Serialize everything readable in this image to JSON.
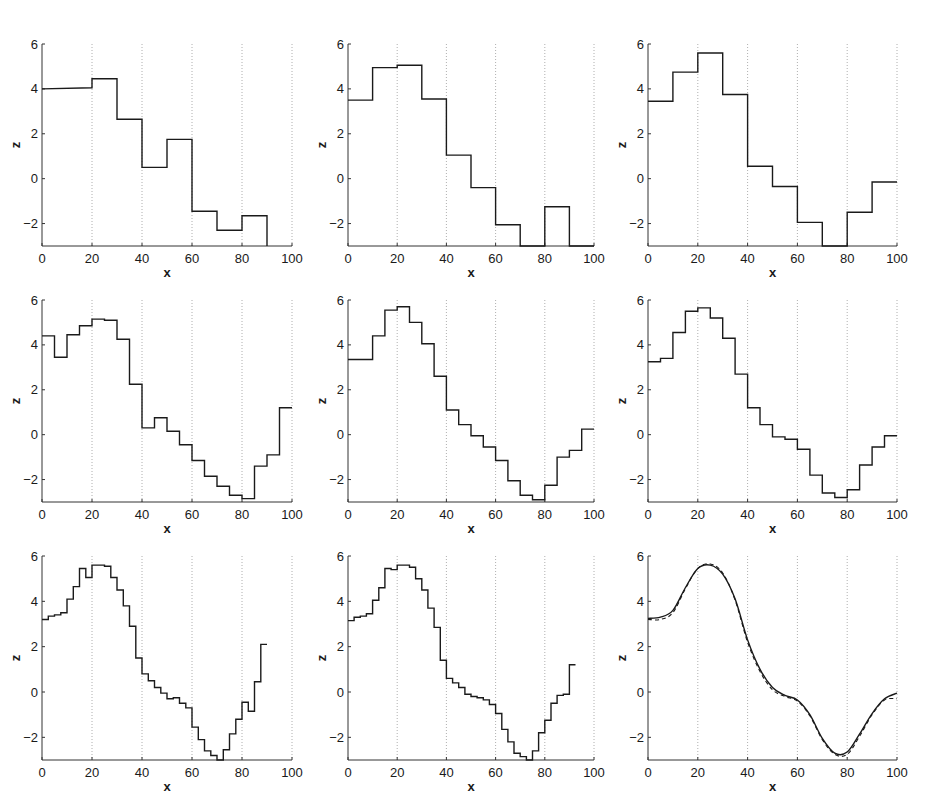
{
  "figure": {
    "background": "#ffffff",
    "line_color": "#1a1a1a",
    "grid_color": "#9a9a9a"
  },
  "chart_data": [
    {
      "type": "line",
      "panel": 1,
      "row": 1,
      "col": 1,
      "style": "step",
      "xlabel": "x",
      "ylabel": "z",
      "xlim": [
        0,
        100
      ],
      "ylim": [
        -3,
        6
      ],
      "xticks": [
        0,
        20,
        40,
        60,
        80,
        100
      ],
      "yticks": [
        -2,
        0,
        2,
        4,
        6
      ],
      "grid": "vertical-dotted",
      "series": [
        {
          "name": "approximation",
          "dash": "solid",
          "x": [
            0,
            20,
            20,
            30,
            30,
            40,
            40,
            50,
            50,
            60,
            60,
            70,
            70,
            80,
            80,
            90,
            90
          ],
          "y": [
            4.0,
            4.05,
            4.45,
            4.45,
            2.65,
            2.65,
            0.5,
            0.5,
            1.75,
            1.75,
            -1.45,
            -1.45,
            -2.3,
            -2.3,
            -1.65,
            -1.65,
            -3.0
          ]
        }
      ]
    },
    {
      "type": "line",
      "panel": 2,
      "row": 1,
      "col": 2,
      "style": "step",
      "xlabel": "x",
      "ylabel": "z",
      "xlim": [
        0,
        100
      ],
      "ylim": [
        -3,
        6
      ],
      "xticks": [
        0,
        20,
        40,
        60,
        80,
        100
      ],
      "yticks": [
        -2,
        0,
        2,
        4,
        6
      ],
      "grid": "vertical-dotted",
      "series": [
        {
          "name": "approximation",
          "dash": "solid",
          "x": [
            0,
            10,
            10,
            20,
            20,
            30,
            30,
            40,
            40,
            50,
            50,
            60,
            60,
            70,
            70,
            80,
            80,
            90,
            90,
            100
          ],
          "y": [
            3.5,
            3.5,
            4.95,
            4.95,
            5.05,
            5.05,
            3.55,
            3.55,
            1.05,
            1.05,
            -0.4,
            -0.4,
            -2.05,
            -2.05,
            -3.0,
            -3.0,
            -1.25,
            -1.25,
            -3.0,
            -3.0
          ]
        }
      ]
    },
    {
      "type": "line",
      "panel": 3,
      "row": 1,
      "col": 3,
      "style": "step",
      "xlabel": "x",
      "ylabel": "z",
      "xlim": [
        0,
        100
      ],
      "ylim": [
        -3,
        6
      ],
      "xticks": [
        0,
        20,
        40,
        60,
        80,
        100
      ],
      "yticks": [
        -2,
        0,
        2,
        4,
        6
      ],
      "grid": "vertical-dotted",
      "series": [
        {
          "name": "approximation",
          "dash": "solid",
          "x": [
            0,
            10,
            10,
            20,
            20,
            30,
            30,
            40,
            40,
            50,
            50,
            60,
            60,
            70,
            70,
            80,
            80,
            90,
            90,
            100
          ],
          "y": [
            3.45,
            3.45,
            4.75,
            4.75,
            5.6,
            5.6,
            3.75,
            3.75,
            0.55,
            0.55,
            -0.35,
            -0.35,
            -1.95,
            -1.95,
            -3.0,
            -3.0,
            -1.5,
            -1.5,
            -0.15,
            -0.15
          ]
        }
      ]
    },
    {
      "type": "line",
      "panel": 4,
      "row": 2,
      "col": 1,
      "style": "step",
      "xlabel": "x",
      "ylabel": "z",
      "xlim": [
        0,
        100
      ],
      "ylim": [
        -3,
        6
      ],
      "xticks": [
        0,
        20,
        40,
        60,
        80,
        100
      ],
      "yticks": [
        -2,
        0,
        2,
        4,
        6
      ],
      "grid": "vertical-dotted",
      "series": [
        {
          "name": "approximation",
          "dash": "solid",
          "x": [
            0,
            5,
            5,
            10,
            10,
            15,
            15,
            20,
            20,
            25,
            25,
            30,
            30,
            35,
            35,
            40,
            40,
            45,
            45,
            50,
            50,
            55,
            55,
            60,
            60,
            65,
            65,
            70,
            70,
            75,
            75,
            80,
            80,
            85,
            85,
            90,
            90,
            95,
            95,
            100
          ],
          "y": [
            4.4,
            4.4,
            3.45,
            3.45,
            4.45,
            4.45,
            4.85,
            4.85,
            5.15,
            5.15,
            5.1,
            5.1,
            4.25,
            4.25,
            2.25,
            2.25,
            0.3,
            0.3,
            0.75,
            0.75,
            0.15,
            0.15,
            -0.45,
            -0.45,
            -1.15,
            -1.15,
            -1.85,
            -1.85,
            -2.3,
            -2.3,
            -2.7,
            -2.7,
            -2.85,
            -2.85,
            -1.4,
            -1.4,
            -0.9,
            -0.9,
            1.2,
            1.2
          ]
        }
      ]
    },
    {
      "type": "line",
      "panel": 5,
      "row": 2,
      "col": 2,
      "style": "step",
      "xlabel": "x",
      "ylabel": "z",
      "xlim": [
        0,
        100
      ],
      "ylim": [
        -3,
        6
      ],
      "xticks": [
        0,
        20,
        40,
        60,
        80,
        100
      ],
      "yticks": [
        -2,
        0,
        2,
        4,
        6
      ],
      "grid": "vertical-dotted",
      "series": [
        {
          "name": "approximation",
          "dash": "solid",
          "x": [
            0,
            10,
            10,
            15,
            15,
            20,
            20,
            25,
            25,
            30,
            30,
            35,
            35,
            40,
            40,
            45,
            45,
            50,
            50,
            55,
            55,
            60,
            60,
            65,
            65,
            70,
            70,
            75,
            75,
            80,
            80,
            85,
            85,
            90,
            90,
            95,
            95,
            100
          ],
          "y": [
            3.35,
            3.35,
            4.4,
            4.4,
            5.55,
            5.55,
            5.7,
            5.7,
            5.0,
            5.0,
            4.05,
            4.05,
            2.6,
            2.6,
            1.1,
            1.1,
            0.45,
            0.45,
            -0.05,
            -0.05,
            -0.55,
            -0.55,
            -1.15,
            -1.15,
            -2.05,
            -2.05,
            -2.7,
            -2.7,
            -2.9,
            -2.9,
            -2.25,
            -2.25,
            -1.0,
            -1.0,
            -0.7,
            -0.7,
            0.25,
            0.25
          ]
        }
      ]
    },
    {
      "type": "line",
      "panel": 6,
      "row": 2,
      "col": 3,
      "style": "step",
      "xlabel": "x",
      "ylabel": "z",
      "xlim": [
        0,
        100
      ],
      "ylim": [
        -3,
        6
      ],
      "xticks": [
        0,
        20,
        40,
        60,
        80,
        100
      ],
      "yticks": [
        -2,
        0,
        2,
        4,
        6
      ],
      "grid": "vertical-dotted",
      "series": [
        {
          "name": "approximation",
          "dash": "solid",
          "x": [
            0,
            5,
            5,
            10,
            10,
            15,
            15,
            20,
            20,
            25,
            25,
            30,
            30,
            35,
            35,
            40,
            40,
            45,
            45,
            50,
            50,
            55,
            55,
            60,
            60,
            65,
            65,
            70,
            70,
            75,
            75,
            80,
            80,
            85,
            85,
            90,
            90,
            95,
            95,
            100
          ],
          "y": [
            3.25,
            3.25,
            3.4,
            3.4,
            4.55,
            4.55,
            5.5,
            5.5,
            5.65,
            5.65,
            5.2,
            5.2,
            4.3,
            4.3,
            2.7,
            2.7,
            1.2,
            1.2,
            0.45,
            0.45,
            -0.1,
            -0.1,
            -0.2,
            -0.2,
            -0.65,
            -0.65,
            -1.8,
            -1.8,
            -2.6,
            -2.6,
            -2.8,
            -2.8,
            -2.45,
            -2.45,
            -1.35,
            -1.35,
            -0.55,
            -0.55,
            -0.05,
            -0.05
          ]
        }
      ]
    },
    {
      "type": "line",
      "panel": 7,
      "row": 3,
      "col": 1,
      "style": "step",
      "xlabel": "x",
      "ylabel": "z",
      "xlim": [
        0,
        100
      ],
      "ylim": [
        -3,
        6
      ],
      "xticks": [
        0,
        20,
        40,
        60,
        80,
        100
      ],
      "yticks": [
        -2,
        0,
        2,
        4,
        6
      ],
      "grid": "vertical-dotted",
      "series": [
        {
          "name": "approximation",
          "dash": "solid",
          "x": [
            0,
            2.5,
            2.5,
            5,
            5,
            7.5,
            7.5,
            10,
            10,
            12.5,
            12.5,
            15,
            15,
            17.5,
            17.5,
            20,
            20,
            22.5,
            22.5,
            25,
            25,
            27.5,
            27.5,
            30,
            30,
            32.5,
            32.5,
            35,
            35,
            37.5,
            37.5,
            40,
            40,
            42.5,
            42.5,
            45,
            45,
            47.5,
            47.5,
            50,
            50,
            52.5,
            52.5,
            55,
            55,
            57.5,
            57.5,
            60,
            60,
            62.5,
            62.5,
            65,
            65,
            67.5,
            67.5,
            70,
            70,
            72.5,
            72.5,
            75,
            75,
            77.5,
            77.5,
            80,
            80,
            82.5,
            82.5,
            85,
            85,
            87.5,
            87.5,
            90,
            90,
            92.5,
            92.5,
            95,
            95,
            97.5,
            97.5,
            100
          ],
          "y": [
            3.2,
            3.2,
            3.35,
            3.35,
            3.4,
            3.4,
            3.5,
            3.5,
            4.1,
            4.1,
            4.65,
            4.65,
            5.45,
            5.45,
            5.05,
            5.05,
            5.6,
            5.6,
            5.6,
            5.6,
            5.55,
            5.55,
            5.05,
            5.05,
            4.5,
            4.5,
            3.8,
            3.8,
            2.9,
            2.9,
            1.5,
            1.5,
            0.8,
            0.8,
            0.5,
            0.5,
            0.2,
            0.2,
            -0.05,
            -0.05,
            -0.3,
            -0.3,
            -0.25,
            -0.25,
            -0.5,
            -0.5,
            -0.7,
            -0.7,
            -1.55,
            -1.55,
            -2.1,
            -2.1,
            -2.6,
            -2.6,
            -2.8,
            -2.8,
            -3.0,
            -3.0,
            -2.55,
            -2.55,
            -1.85,
            -1.85,
            -1.2,
            -1.2,
            -0.45,
            -0.45,
            -0.85,
            -0.85,
            0.45,
            0.45,
            2.1,
            2.1
          ]
        }
      ]
    },
    {
      "type": "line",
      "panel": 8,
      "row": 3,
      "col": 2,
      "style": "step",
      "xlabel": "x",
      "ylabel": "z",
      "xlim": [
        0,
        100
      ],
      "ylim": [
        -3,
        6
      ],
      "xticks": [
        0,
        20,
        40,
        60,
        80,
        100
      ],
      "yticks": [
        -2,
        0,
        2,
        4,
        6
      ],
      "grid": "vertical-dotted",
      "series": [
        {
          "name": "approximation",
          "dash": "solid",
          "x": [
            0,
            2.5,
            2.5,
            5,
            5,
            7.5,
            7.5,
            10,
            10,
            12.5,
            12.5,
            15,
            15,
            17.5,
            17.5,
            20,
            20,
            22.5,
            22.5,
            25,
            25,
            27.5,
            27.5,
            30,
            30,
            32.5,
            32.5,
            35,
            35,
            37.5,
            37.5,
            40,
            40,
            42.5,
            42.5,
            45,
            45,
            47.5,
            47.5,
            50,
            50,
            52.5,
            52.5,
            55,
            55,
            57.5,
            57.5,
            60,
            60,
            62.5,
            62.5,
            65,
            65,
            67.5,
            67.5,
            70,
            70,
            72.5,
            72.5,
            75,
            75,
            77.5,
            77.5,
            80,
            80,
            82.5,
            82.5,
            85,
            85,
            87.5,
            87.5,
            90,
            90,
            92.5,
            92.5,
            95,
            95,
            97.5,
            97.5,
            100
          ],
          "y": [
            3.15,
            3.15,
            3.3,
            3.3,
            3.35,
            3.35,
            3.45,
            3.45,
            4.05,
            4.05,
            4.6,
            4.6,
            5.45,
            5.45,
            5.4,
            5.4,
            5.6,
            5.6,
            5.6,
            5.6,
            5.5,
            5.5,
            5.0,
            5.0,
            4.5,
            4.5,
            3.7,
            3.7,
            2.85,
            2.85,
            1.4,
            1.4,
            0.6,
            0.6,
            0.4,
            0.4,
            0.2,
            0.2,
            -0.1,
            -0.1,
            -0.2,
            -0.2,
            -0.25,
            -0.25,
            -0.35,
            -0.35,
            -0.55,
            -0.55,
            -0.95,
            -0.95,
            -1.65,
            -1.65,
            -2.2,
            -2.2,
            -2.7,
            -2.7,
            -2.85,
            -2.85,
            -3.0,
            -3.0,
            -2.6,
            -2.6,
            -1.8,
            -1.8,
            -1.25,
            -1.25,
            -0.5,
            -0.5,
            -0.15,
            -0.15,
            -0.1,
            -0.1,
            1.2,
            1.2
          ]
        }
      ]
    },
    {
      "type": "line",
      "panel": 9,
      "row": 3,
      "col": 3,
      "style": "smooth",
      "xlabel": "x",
      "ylabel": "z",
      "xlim": [
        0,
        100
      ],
      "ylim": [
        -3,
        6
      ],
      "xticks": [
        0,
        20,
        40,
        60,
        80,
        100
      ],
      "yticks": [
        -2,
        0,
        2,
        4,
        6
      ],
      "grid": "vertical-dotted",
      "series": [
        {
          "name": "approximation",
          "dash": "solid",
          "x": [
            0,
            5,
            10,
            15,
            20,
            25,
            30,
            35,
            40,
            45,
            50,
            55,
            60,
            65,
            70,
            75,
            80,
            85,
            90,
            95,
            100
          ],
          "y": [
            3.25,
            3.3,
            3.6,
            4.6,
            5.45,
            5.6,
            5.2,
            4.1,
            2.3,
            1.0,
            0.2,
            -0.15,
            -0.35,
            -1.0,
            -2.05,
            -2.7,
            -2.65,
            -1.85,
            -0.95,
            -0.3,
            -0.05
          ]
        },
        {
          "name": "true function",
          "dash": "dashed",
          "x": [
            0,
            5,
            10,
            15,
            20,
            25,
            30,
            35,
            40,
            45,
            50,
            55,
            60,
            65,
            70,
            75,
            80,
            85,
            90,
            95,
            100
          ],
          "y": [
            3.2,
            3.2,
            3.5,
            4.55,
            5.45,
            5.65,
            5.25,
            4.05,
            2.2,
            0.9,
            0.1,
            -0.2,
            -0.4,
            -1.05,
            -2.1,
            -2.75,
            -2.75,
            -1.95,
            -1.0,
            -0.35,
            -0.3
          ]
        }
      ]
    }
  ]
}
